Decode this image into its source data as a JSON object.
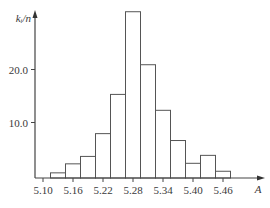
{
  "chart_data": {
    "type": "bar",
    "subtype": "histogram",
    "title": "",
    "xlabel": "A",
    "ylabel": "k_i/n",
    "ylabel_display": "kᵢ/n",
    "bin_width": 0.03,
    "bin_edges": [
      5.115,
      5.145,
      5.175,
      5.205,
      5.235,
      5.265,
      5.295,
      5.325,
      5.355,
      5.385,
      5.415,
      5.445,
      5.475
    ],
    "values": [
      0.5,
      2.2,
      3.6,
      7.9,
      15.3,
      30.9,
      20.9,
      12.3,
      6.6,
      2.3,
      3.8,
      0.8
    ],
    "x_ticks": [
      5.1,
      5.16,
      5.22,
      5.28,
      5.34,
      5.4,
      5.46
    ],
    "x_tick_labels": [
      "5.10",
      "5.16",
      "5.22",
      "5.28",
      "5.34",
      "5.40",
      "5.46"
    ],
    "y_ticks": [
      10.0,
      20.0
    ],
    "y_tick_labels": [
      "10.0",
      "20.0"
    ],
    "xlim": [
      5.08,
      5.54
    ],
    "ylim": [
      0,
      31.5
    ],
    "grid": false,
    "legend": null,
    "bar_fill": "#ffffff",
    "bar_stroke": "#555555",
    "axis_color": "#444444"
  }
}
